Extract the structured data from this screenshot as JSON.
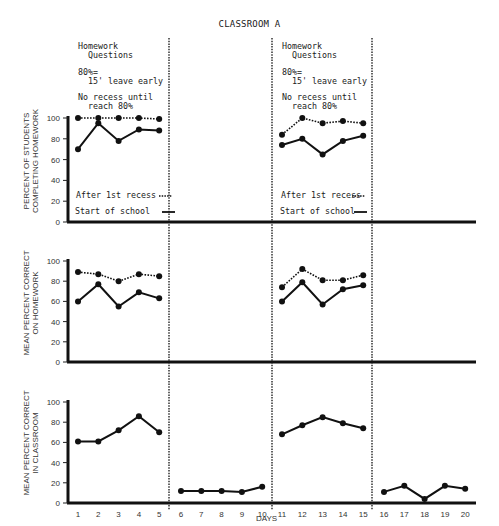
{
  "title": "CLASSROOM A",
  "phase_notes": {
    "line1": "Homework",
    "line2": "  Questions",
    "line3": "80%=",
    "line4": "  15' leave early",
    "line5": "No recess until",
    "line6": "  reach 80%"
  },
  "legend": {
    "after_recess": "After 1st recess",
    "start_school": "Start of school"
  },
  "x_axis_label": "DAYS",
  "chart_data": [
    {
      "type": "line",
      "title": "",
      "ylabel": "PERCENT OF STUDENTS\nCOMPLETING HOMEWORK",
      "xlabel": "DAYS",
      "ylim": [
        0,
        100
      ],
      "yticks": [
        0,
        20,
        40,
        60,
        80,
        100
      ],
      "x": [
        1,
        2,
        3,
        4,
        5,
        6,
        7,
        8,
        9,
        10,
        11,
        12,
        13,
        14,
        15,
        16,
        17,
        18,
        19,
        20
      ],
      "phases": [
        [
          1,
          5
        ],
        [
          6,
          10
        ],
        [
          11,
          15
        ],
        [
          16,
          20
        ]
      ],
      "series": [
        {
          "name": "After 1st recess",
          "style": "dotted",
          "values": [
            100,
            100,
            100,
            100,
            99,
            null,
            null,
            null,
            null,
            null,
            84,
            100,
            95,
            97,
            95,
            null,
            null,
            null,
            null,
            null
          ]
        },
        {
          "name": "Start of school",
          "style": "solid",
          "values": [
            70,
            95,
            78,
            89,
            88,
            null,
            null,
            null,
            null,
            null,
            74,
            80,
            65,
            78,
            83,
            null,
            null,
            null,
            null,
            null
          ]
        }
      ]
    },
    {
      "type": "line",
      "ylabel": "MEAN PERCENT CORRECT\nON HOMEWORK",
      "xlabel": "DAYS",
      "ylim": [
        0,
        100
      ],
      "yticks": [
        0,
        20,
        40,
        60,
        80,
        100
      ],
      "x": [
        1,
        2,
        3,
        4,
        5,
        6,
        7,
        8,
        9,
        10,
        11,
        12,
        13,
        14,
        15,
        16,
        17,
        18,
        19,
        20
      ],
      "series": [
        {
          "name": "After 1st recess",
          "style": "dotted",
          "values": [
            89,
            87,
            80,
            87,
            85,
            null,
            null,
            null,
            null,
            null,
            74,
            92,
            81,
            81,
            86,
            null,
            null,
            null,
            null,
            null
          ]
        },
        {
          "name": "Start of school",
          "style": "solid",
          "values": [
            60,
            77,
            55,
            69,
            63,
            null,
            null,
            null,
            null,
            null,
            60,
            79,
            57,
            72,
            76,
            null,
            null,
            null,
            null,
            null
          ]
        }
      ]
    },
    {
      "type": "line",
      "ylabel": "MEAN PERCENT CORRECT\nIN CLASSROOM",
      "xlabel": "DAYS",
      "ylim": [
        0,
        100
      ],
      "yticks": [
        0,
        20,
        40,
        60,
        80,
        100
      ],
      "x": [
        1,
        2,
        3,
        4,
        5,
        6,
        7,
        8,
        9,
        10,
        11,
        12,
        13,
        14,
        15,
        16,
        17,
        18,
        19,
        20
      ],
      "series": [
        {
          "name": "Classroom",
          "style": "solid",
          "values": [
            61,
            61,
            72,
            86,
            70,
            12,
            12,
            12,
            11,
            16,
            68,
            77,
            85,
            79,
            74,
            11,
            17,
            4,
            17,
            14
          ]
        }
      ]
    }
  ]
}
